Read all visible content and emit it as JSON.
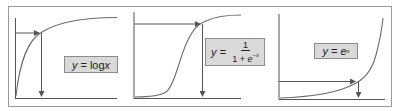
{
  "figure": {
    "panels": [
      {
        "id": "log",
        "label": {
          "lhs": "y",
          "eq": " = ",
          "rhs": "log",
          "var": "x"
        },
        "curve": "logarithmic"
      },
      {
        "id": "sigmoid",
        "label": {
          "lhs": "y",
          "eq": " = ",
          "numerator": "1",
          "denominator_prefix": "1 + ",
          "denominator_base": "e",
          "denominator_exp": "−x"
        },
        "curve": "sigmoid"
      },
      {
        "id": "exp",
        "label": {
          "lhs": "y",
          "eq": " = ",
          "base": "e",
          "exp": "x"
        },
        "curve": "exponential"
      }
    ],
    "colors": {
      "axis": "#555555",
      "curve": "#6b6b6b",
      "arrow": "#555555",
      "frame": "#9a9a9a",
      "label_bg": "#d9d9d9",
      "label_border": "#8c8c8c"
    }
  }
}
